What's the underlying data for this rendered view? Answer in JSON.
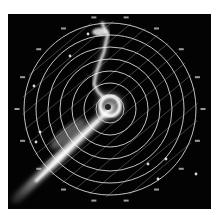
{
  "display": {
    "type": "radar-ppi-scope",
    "background": "#030303",
    "frame_background": "#ffffff",
    "ring_color": "#d8d8d8",
    "scan_line_color": "#9a9a9a",
    "echo_color": "#ffffff"
  },
  "center": {
    "x": 102,
    "y": 95
  },
  "range_rings": [
    14,
    26,
    38,
    50,
    62,
    74,
    86
  ],
  "scan_lines": {
    "angle_deg": -40,
    "spacing": 13,
    "count": 16
  },
  "rim_labels": [
    {
      "angle": -100,
      "text": "·"
    },
    {
      "angle": -80,
      "text": "·"
    },
    {
      "angle": -60,
      "text": "·"
    },
    {
      "angle": -40,
      "text": "·"
    },
    {
      "angle": -20,
      "text": "·"
    },
    {
      "angle": 0,
      "text": "·"
    },
    {
      "angle": 20,
      "text": "·"
    },
    {
      "angle": 40,
      "text": "·"
    },
    {
      "angle": 60,
      "text": "·"
    },
    {
      "angle": 80,
      "text": "·"
    },
    {
      "angle": 100,
      "text": "·"
    },
    {
      "angle": 120,
      "text": "·"
    },
    {
      "angle": 140,
      "text": "·"
    },
    {
      "angle": 160,
      "text": "·"
    },
    {
      "angle": 180,
      "text": "·"
    },
    {
      "angle": 200,
      "text": "·"
    },
    {
      "angle": 220,
      "text": "·"
    },
    {
      "angle": 240,
      "text": "·"
    }
  ],
  "echoes": {
    "main_streak": {
      "from": [
        8,
        185
      ],
      "to": [
        102,
        95
      ]
    },
    "spiral_center": {
      "x": 102,
      "y": 92,
      "r": 14
    },
    "coastline_points": [
      [
        94,
        8
      ],
      [
        96,
        14
      ],
      [
        100,
        20
      ],
      [
        98,
        28
      ],
      [
        96,
        38
      ],
      [
        92,
        48
      ],
      [
        88,
        60
      ],
      [
        86,
        70
      ],
      [
        90,
        78
      ],
      [
        96,
        84
      ]
    ],
    "scattered_echoes": [
      [
        26,
        72
      ],
      [
        32,
        118
      ],
      [
        28,
        128
      ],
      [
        62,
        42
      ],
      [
        80,
        20
      ],
      [
        140,
        150
      ],
      [
        150,
        165
      ],
      [
        158,
        145
      ],
      [
        188,
        160
      ],
      [
        192,
        200
      ]
    ]
  }
}
